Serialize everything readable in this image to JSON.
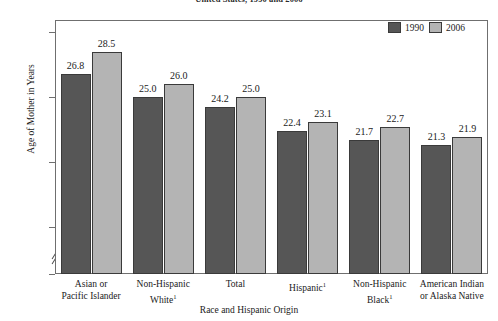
{
  "chart_data": {
    "type": "bar",
    "title": "United States, 1990 and 2006",
    "xlabel": "Race and Hispanic Origin",
    "ylabel": "Age of Mother in Years",
    "ylim": [
      0,
      30
    ],
    "y_ticks": [
      "0",
      "15",
      "20",
      "25",
      "30"
    ],
    "axis_break": true,
    "grid": false,
    "legend_position": "top-right",
    "categories": [
      "Asian or Pacific Islander",
      "Non-Hispanic White¹",
      "Total",
      "Hispanic¹",
      "Non-Hispanic Black¹",
      "American Indian or Alaska Native"
    ],
    "category_lines": [
      [
        "Asian or",
        "Pacific Islander"
      ],
      [
        "Non-Hispanic",
        "White¹"
      ],
      [
        "Total",
        ""
      ],
      [
        "Hispanic¹",
        ""
      ],
      [
        "Non-Hispanic",
        "Black¹"
      ],
      [
        "American Indian",
        "or Alaska Native"
      ]
    ],
    "series": [
      {
        "name": "1990",
        "color": "#565656",
        "values": [
          26.8,
          25.0,
          24.2,
          22.4,
          21.7,
          21.3
        ]
      },
      {
        "name": "2006",
        "color": "#b4b4b4",
        "values": [
          28.5,
          26.0,
          25.0,
          23.1,
          22.7,
          21.9
        ]
      }
    ],
    "value_labels": [
      [
        "26.8",
        "28.5"
      ],
      [
        "25.0",
        "26.0"
      ],
      [
        "24.2",
        "25.0"
      ],
      [
        "22.4",
        "23.1"
      ],
      [
        "21.7",
        "22.7"
      ],
      [
        "21.3",
        "21.9"
      ]
    ]
  },
  "legend": {
    "items": [
      {
        "label": "1990"
      },
      {
        "label": "2006"
      }
    ]
  }
}
